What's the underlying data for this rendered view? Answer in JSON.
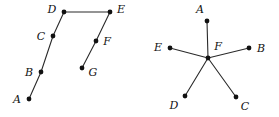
{
  "figure": {
    "background_color": "#ffffff",
    "ink_color": "#111111",
    "edge_color": "#2a2a2a",
    "width": 279,
    "height": 117
  },
  "chart_data": {
    "type": "diagram",
    "title": "",
    "subtitle": "",
    "graphs": [
      {
        "id": "left-graph",
        "name": "path-graph",
        "vertex_count": 7,
        "edge_count": 6,
        "vertices": [
          {
            "label": "A",
            "x": 29,
            "y": 99,
            "label_x": 17,
            "label_y": 99
          },
          {
            "label": "B",
            "x": 41,
            "y": 72,
            "label_x": 29,
            "label_y": 72
          },
          {
            "label": "C",
            "x": 53,
            "y": 36,
            "label_x": 41,
            "label_y": 36
          },
          {
            "label": "D",
            "x": 64,
            "y": 12,
            "label_x": 52,
            "label_y": 9
          },
          {
            "label": "E",
            "x": 110,
            "y": 12,
            "label_x": 121,
            "label_y": 9
          },
          {
            "label": "F",
            "x": 96,
            "y": 41,
            "label_x": 107,
            "label_y": 41
          },
          {
            "label": "G",
            "x": 82,
            "y": 68,
            "label_x": 93,
            "label_y": 72
          }
        ],
        "edges": [
          {
            "from": "A",
            "to": "B"
          },
          {
            "from": "B",
            "to": "C"
          },
          {
            "from": "C",
            "to": "D"
          },
          {
            "from": "D",
            "to": "E"
          },
          {
            "from": "E",
            "to": "F"
          },
          {
            "from": "F",
            "to": "G"
          }
        ]
      },
      {
        "id": "right-graph",
        "name": "star-graph",
        "vertex_count": 6,
        "edge_count": 5,
        "vertices": [
          {
            "label": "A",
            "x": 207,
            "y": 21,
            "label_x": 200,
            "label_y": 9
          },
          {
            "label": "B",
            "x": 249,
            "y": 48,
            "label_x": 261,
            "label_y": 48
          },
          {
            "label": "C",
            "x": 236,
            "y": 97,
            "label_x": 245,
            "label_y": 106
          },
          {
            "label": "D",
            "x": 185,
            "y": 96,
            "label_x": 174,
            "label_y": 105
          },
          {
            "label": "E",
            "x": 170,
            "y": 48,
            "label_x": 158,
            "label_y": 47
          },
          {
            "label": "F",
            "x": 208,
            "y": 58,
            "label_x": 218,
            "label_y": 46
          }
        ],
        "edges": [
          {
            "from": "F",
            "to": "A"
          },
          {
            "from": "F",
            "to": "B"
          },
          {
            "from": "F",
            "to": "C"
          },
          {
            "from": "F",
            "to": "D"
          },
          {
            "from": "F",
            "to": "E"
          }
        ]
      }
    ]
  }
}
